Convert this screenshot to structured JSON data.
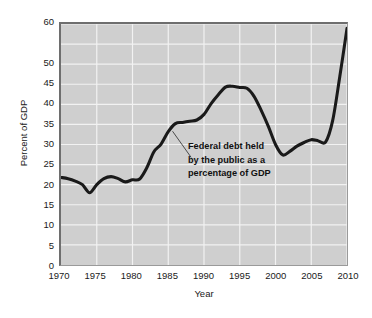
{
  "chart_data": {
    "type": "line",
    "title": "",
    "xlabel": "Year",
    "ylabel": "Percent of GDP",
    "xlim": [
      1970,
      2010
    ],
    "ylim": [
      0,
      60
    ],
    "grid": true,
    "legend": false,
    "legend_position": "none",
    "line_color": "#1a1a1a",
    "plot_background": "#cfcfcf",
    "gridline_color": "#f2f2f2",
    "frame_color": "#6e6e6e",
    "xtick_labels": [
      "1970",
      "1975",
      "1980",
      "1985",
      "1990",
      "1995",
      "2000",
      "2005",
      "2010"
    ],
    "xtick_values": [
      1970,
      1975,
      1980,
      1985,
      1990,
      1995,
      2000,
      2005,
      2010
    ],
    "ytick_labels": [
      "0",
      "5",
      "10",
      "15",
      "20",
      "25",
      "30",
      "35",
      "40",
      "45",
      "50",
      "60"
    ],
    "ytick_values": [
      0,
      5,
      10,
      15,
      20,
      25,
      30,
      35,
      40,
      45,
      50,
      60
    ],
    "ygrid_values": [
      5,
      10,
      15,
      20,
      25,
      30,
      35,
      40,
      45,
      50,
      55
    ],
    "series": [
      {
        "name": "Federal debt held by the public as a percentage of GDP",
        "x": [
          1970,
          1971,
          1972,
          1973,
          1974,
          1975,
          1976,
          1977,
          1978,
          1979,
          1980,
          1981,
          1982,
          1983,
          1984,
          1985,
          1986,
          1987,
          1988,
          1989,
          1990,
          1991,
          1992,
          1993,
          1994,
          1995,
          1996,
          1997,
          1998,
          1999,
          2000,
          2001,
          2002,
          2003,
          2004,
          2005,
          2006,
          2007,
          2008,
          2009,
          2010
        ],
        "values": [
          21.8,
          21.5,
          20.9,
          20.0,
          18.0,
          20.0,
          21.5,
          22.0,
          21.5,
          20.7,
          21.2,
          21.4,
          24.2,
          28.2,
          30.1,
          33.2,
          35.2,
          35.5,
          35.8,
          36.1,
          37.5,
          40.2,
          42.4,
          44.3,
          44.5,
          44.2,
          44.0,
          42.0,
          38.5,
          34.5,
          30.0,
          27.4,
          28.3,
          29.6,
          30.5,
          31.2,
          30.9,
          30.6,
          36.0,
          47.0,
          58.9
        ]
      }
    ],
    "annotations": [
      {
        "name": "series-callout",
        "lines": [
          "Federal debt held",
          "by the public as a",
          "percentage of GDP"
        ],
        "target_x": 1985.6,
        "target_y": 33.5,
        "leader_from": [
          1988.2,
          26.8
        ],
        "leader_to": [
          1985.6,
          33.3
        ]
      }
    ]
  }
}
